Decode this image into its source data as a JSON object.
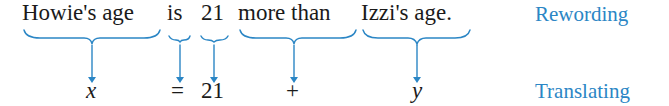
{
  "colors": {
    "accent": "#2b86c5",
    "text": "#1a1a1a"
  },
  "sentence": {
    "phrases": [
      {
        "text": "Howie's age"
      },
      {
        "text": "is"
      },
      {
        "text": "21"
      },
      {
        "text": "more than"
      },
      {
        "text": "Izzi's age."
      }
    ]
  },
  "translation": {
    "symbols": [
      {
        "text": "x"
      },
      {
        "text": "="
      },
      {
        "text": "21"
      },
      {
        "text": "+"
      },
      {
        "text": "y"
      }
    ]
  },
  "labels": {
    "rewording": "Rewording",
    "translating": "Translating"
  }
}
